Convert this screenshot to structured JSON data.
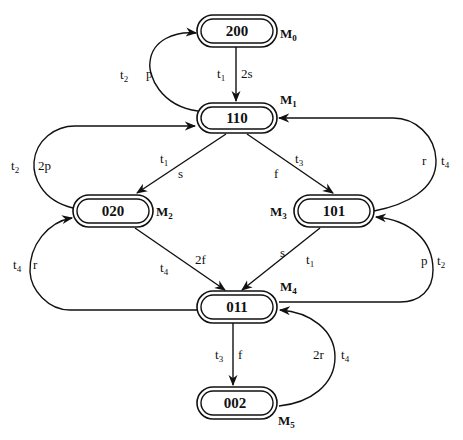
{
  "diagram": {
    "type": "reachability-graph",
    "nodes": [
      {
        "id": "M0",
        "label": "200",
        "marking": "M",
        "marking_sub": "0",
        "x": 197,
        "y": 15
      },
      {
        "id": "M1",
        "label": "110",
        "marking": "M",
        "marking_sub": "1",
        "x": 197,
        "y": 103
      },
      {
        "id": "M2",
        "label": "020",
        "marking": "M",
        "marking_sub": "2",
        "x": 73,
        "y": 195
      },
      {
        "id": "M3",
        "label": "101",
        "marking": "M",
        "marking_sub": "3",
        "x": 292,
        "y": 195
      },
      {
        "id": "M4",
        "label": "011",
        "marking": "M",
        "marking_sub": "4",
        "x": 197,
        "y": 291
      },
      {
        "id": "M5",
        "label": "002",
        "marking": "M",
        "marking_sub": "5",
        "x": 197,
        "y": 387
      }
    ],
    "edges": [
      {
        "from": "M0",
        "to": "M1",
        "transition": "t",
        "transition_sub": "1",
        "weight": "2s"
      },
      {
        "from": "M1",
        "to": "M0",
        "transition": "t",
        "transition_sub": "2",
        "weight": "p"
      },
      {
        "from": "M1",
        "to": "M2",
        "transition": "t",
        "transition_sub": "1",
        "weight": "s"
      },
      {
        "from": "M2",
        "to": "M1",
        "transition": "t",
        "transition_sub": "2",
        "weight": "2p"
      },
      {
        "from": "M1",
        "to": "M3",
        "transition": "t",
        "transition_sub": "3",
        "weight": "f"
      },
      {
        "from": "M3",
        "to": "M1",
        "transition": "t",
        "transition_sub": "4",
        "weight": "r"
      },
      {
        "from": "M2",
        "to": "M4",
        "transition": "t",
        "transition_sub": "4",
        "weight": "2f"
      },
      {
        "from": "M4",
        "to": "M2",
        "transition": "t",
        "transition_sub": "4",
        "weight": "r"
      },
      {
        "from": "M3",
        "to": "M4",
        "transition": "t",
        "transition_sub": "1",
        "weight": "s"
      },
      {
        "from": "M4",
        "to": "M3",
        "transition": "t",
        "transition_sub": "2",
        "weight": "p"
      },
      {
        "from": "M4",
        "to": "M5",
        "transition": "t",
        "transition_sub": "3",
        "weight": "f"
      },
      {
        "from": "M5",
        "to": "M4",
        "transition": "t",
        "transition_sub": "4",
        "weight": "2r"
      }
    ]
  }
}
